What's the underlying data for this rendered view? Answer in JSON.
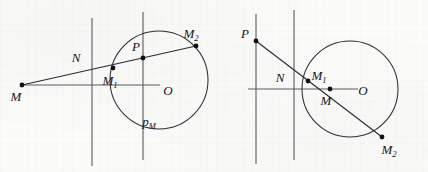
{
  "figure": {
    "type": "geometry-diagram",
    "background_color": "#fbfbfa",
    "ink_color": "#2e2e34",
    "panels": [
      {
        "id": "left",
        "name": "panel-left",
        "circle": {
          "cx": 159,
          "cy": 80,
          "r": 49
        },
        "vertical_lines": [
          {
            "x": 92,
            "y1": 18,
            "y2": 166
          },
          {
            "x": 143,
            "y1": 12,
            "y2": 160
          }
        ],
        "horizontal_line": {
          "x1": 22,
          "y1": 85,
          "x2": 160,
          "y2": 85
        },
        "secant": {
          "x1": 22,
          "y1": 85,
          "x2": 196,
          "y2": 46
        },
        "points": [
          {
            "label": "M",
            "x": 22,
            "y": 85,
            "lx": 16,
            "ly": 101,
            "dot": true
          },
          {
            "label": "M",
            "sub": "1",
            "x": 113,
            "y": 68,
            "lx": 110,
            "ly": 85,
            "dot": true
          },
          {
            "label": "P",
            "x": 143,
            "y": 58,
            "lx": 136,
            "ly": 51,
            "dot": true
          },
          {
            "label": "M",
            "sub": "2",
            "x": 196,
            "y": 46,
            "lx": 191,
            "ly": 38,
            "dot": true
          },
          {
            "label": "N",
            "x": 92,
            "y": 70,
            "lx": 76,
            "ly": 62,
            "dot": false
          },
          {
            "label": "O",
            "x": 170,
            "y": 85,
            "lx": 166,
            "ly": 93,
            "dot": false
          },
          {
            "label": "p",
            "sub": "M",
            "x": 150,
            "y": 120,
            "lx": 146,
            "ly": 124,
            "dot": false
          }
        ]
      },
      {
        "id": "right",
        "name": "panel-right",
        "circle": {
          "cx": 350,
          "cy": 89,
          "r": 48
        },
        "vertical_lines": [
          {
            "x": 256,
            "y1": 14,
            "y2": 164
          },
          {
            "x": 294,
            "y1": 10,
            "y2": 160
          }
        ],
        "horizontal_line": {
          "x1": 248,
          "y1": 89,
          "x2": 358,
          "y2": 89
        },
        "secant": {
          "x1": 256,
          "y1": 41,
          "x2": 382,
          "y2": 137
        },
        "points": [
          {
            "label": "P",
            "x": 256,
            "y": 41,
            "lx": 245,
            "ly": 38,
            "dot": true
          },
          {
            "label": "M",
            "sub": "1",
            "x": 308,
            "y": 81,
            "lx": 316,
            "ly": 82,
            "dot": true
          },
          {
            "label": "M",
            "x": 330,
            "y": 89,
            "lx": 326,
            "ly": 105,
            "dot": true
          },
          {
            "label": "M",
            "sub": "2",
            "x": 382,
            "y": 137,
            "lx": 385,
            "ly": 153,
            "dot": true
          },
          {
            "label": "N",
            "x": 294,
            "y": 70,
            "lx": 280,
            "ly": 82,
            "dot": false
          },
          {
            "label": "O",
            "x": 363,
            "y": 89,
            "lx": 360,
            "ly": 95,
            "dot": false
          }
        ]
      }
    ]
  }
}
